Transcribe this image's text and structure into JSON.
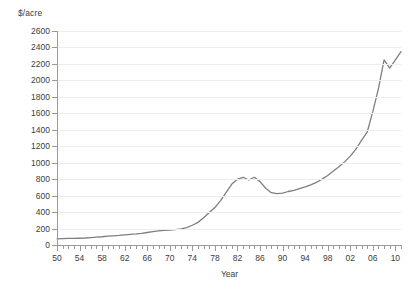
{
  "chart_data": {
    "type": "line",
    "title": "",
    "subtitle": "",
    "xlabel": "Year",
    "ylabel": "$/acre",
    "y_unit_caption": "$/acre",
    "xlim": [
      1950,
      2011
    ],
    "ylim": [
      0,
      2600
    ],
    "y_tick_step": 200,
    "yticks": [
      0,
      200,
      400,
      600,
      800,
      1000,
      1200,
      1400,
      1600,
      1800,
      2000,
      2200,
      2400,
      2600
    ],
    "ytick_labels": [
      "0",
      "200",
      "400",
      "600",
      "800",
      "1000",
      "1200",
      "1400",
      "1600",
      "1800",
      "2000",
      "2200",
      "2400",
      "2600"
    ],
    "xticks": [
      1950,
      1954,
      1958,
      1962,
      1966,
      1970,
      1974,
      1978,
      1982,
      1986,
      1990,
      1994,
      1998,
      2002,
      2006,
      2010
    ],
    "xtick_labels": [
      "50",
      "54",
      "58",
      "62",
      "66",
      "70",
      "74",
      "78",
      "82",
      "86",
      "90",
      "94",
      "98",
      "02",
      "06",
      "10"
    ],
    "xtick_minor_step": 1,
    "grid": "horizontal",
    "legend": "none",
    "line_color": "#7f7f7f",
    "line_width": 1.3,
    "gridline_color": "#ededed",
    "axis_color": "#9a9a9a",
    "text_color": "#3c3c3c",
    "background": "#ffffff",
    "x": [
      1950,
      1951,
      1952,
      1953,
      1954,
      1955,
      1956,
      1957,
      1958,
      1959,
      1960,
      1961,
      1962,
      1963,
      1964,
      1965,
      1966,
      1967,
      1968,
      1969,
      1970,
      1971,
      1972,
      1973,
      1974,
      1975,
      1976,
      1977,
      1978,
      1979,
      1980,
      1981,
      1982,
      1983,
      1984,
      1985,
      1986,
      1987,
      1988,
      1989,
      1990,
      1991,
      1992,
      1993,
      1994,
      1995,
      1996,
      1997,
      1998,
      1999,
      2000,
      2001,
      2002,
      2003,
      2004,
      2005,
      2006,
      2007,
      2008,
      2009,
      2010,
      2011
    ],
    "values": [
      75,
      78,
      80,
      80,
      82,
      85,
      90,
      95,
      100,
      108,
      112,
      116,
      122,
      128,
      134,
      142,
      152,
      163,
      172,
      178,
      182,
      188,
      196,
      212,
      240,
      275,
      330,
      395,
      455,
      540,
      640,
      740,
      800,
      823,
      790,
      823,
      770,
      690,
      635,
      625,
      630,
      650,
      665,
      685,
      705,
      730,
      760,
      800,
      845,
      900,
      950,
      1010,
      1080,
      1165,
      1270,
      1370,
      1620,
      1900,
      2250,
      2150,
      2250,
      2350
    ]
  }
}
